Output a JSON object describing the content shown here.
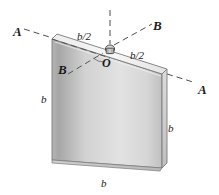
{
  "figure": {
    "name": "square-plate-with-axes-diagram",
    "colors": {
      "plate_face_light": "#e8e8e8",
      "plate_face_dark": "#a8a8a8",
      "plate_edge_top": "#f0f0f0",
      "plate_edge_side": "#c9c9c9",
      "outline": "#6a6a6a",
      "dash_line": "#555555",
      "text": "#1a1a1a",
      "background": "#ffffff"
    },
    "labels": {
      "axis_a_left": "A",
      "axis_a_right": "A",
      "axis_b_upper_right": "B",
      "axis_b_lower_left": "B",
      "origin": "O",
      "dim_half_left": "b/2",
      "dim_half_right": "b/2",
      "dim_side_left": "b",
      "dim_side_right": "b",
      "dim_side_bottom": "b"
    },
    "label_positions": {
      "axis_a_left": {
        "x": 13,
        "y": 25
      },
      "axis_a_right": {
        "x": 198,
        "y": 83
      },
      "axis_b_upper_right": {
        "x": 153,
        "y": 19
      },
      "axis_b_lower_left": {
        "x": 58,
        "y": 63
      },
      "origin": {
        "x": 102,
        "y": 57
      },
      "dim_half_left": {
        "x": 77,
        "y": 31
      },
      "dim_half_right": {
        "x": 130,
        "y": 50
      },
      "dim_side_left": {
        "x": 41,
        "y": 94
      },
      "dim_side_right": {
        "x": 168,
        "y": 123
      },
      "dim_side_bottom": {
        "x": 101,
        "y": 178
      }
    }
  }
}
